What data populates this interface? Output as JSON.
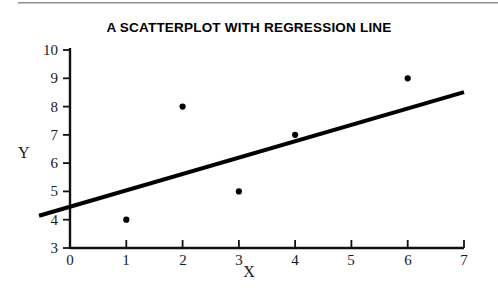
{
  "figure": {
    "title": "A SCATTERPLOT WITH REGRESSION LINE",
    "background_color": "#ffffff",
    "ink_color": "#000000",
    "top_rule_color": "#8e8e8e"
  },
  "chart_data": {
    "type": "scatter",
    "title": "A SCATTERPLOT WITH REGRESSION LINE",
    "xlabel": "X",
    "ylabel": "Y",
    "xlim": [
      0,
      7
    ],
    "ylim": [
      3,
      10
    ],
    "xticks": [
      0,
      1,
      2,
      3,
      4,
      5,
      6,
      7
    ],
    "yticks": [
      3,
      4,
      5,
      6,
      7,
      8,
      9,
      10
    ],
    "xtick_labels": [
      "0",
      "1",
      "2",
      "3",
      "4",
      "5",
      "6",
      "7"
    ],
    "ytick_labels": [
      "3",
      "4",
      "5",
      "6",
      "7",
      "8",
      "9",
      "10"
    ],
    "grid": false,
    "legend": false,
    "series": [
      {
        "name": "observations",
        "marker": "filled-circle",
        "marker_color": "#000000",
        "x": [
          1,
          2,
          3,
          4,
          6
        ],
        "y": [
          4,
          8,
          5,
          7,
          9
        ],
        "points": [
          {
            "x": 1,
            "y": 4
          },
          {
            "x": 2,
            "y": 8
          },
          {
            "x": 3,
            "y": 5
          },
          {
            "x": 4,
            "y": 7
          },
          {
            "x": 6,
            "y": 9
          }
        ]
      }
    ],
    "regression_line": {
      "name": "regression line",
      "color": "#000000",
      "slope": 0.5786,
      "intercept": 4.4571,
      "draw_from": {
        "x": -0.55,
        "y": 4.139
      },
      "draw_to": {
        "x": 7.0,
        "y": 8.508
      }
    }
  },
  "axes": {
    "y_axis_label": "Y",
    "x_axis_label": "X"
  }
}
